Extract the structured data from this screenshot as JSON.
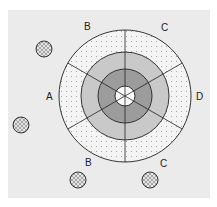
{
  "diagram": {
    "background_color": "#ebebeb",
    "target": {
      "center": [
        125,
        96
      ],
      "rings": [
        {
          "name": "outer-ring",
          "radius": 66,
          "fill": "dotted",
          "color": "#f3f3f3"
        },
        {
          "name": "middle-ring",
          "radius": 44,
          "fill": "light-gray",
          "color": "#c8c8c8"
        },
        {
          "name": "inner-ring",
          "radius": 27,
          "fill": "dark-gray",
          "color": "#9a9a9a"
        },
        {
          "name": "bullseye",
          "radius": 10,
          "fill": "white",
          "color": "#ffffff"
        }
      ],
      "spokes": 6
    },
    "labels": [
      {
        "text": "B",
        "x": 87,
        "y": 30,
        "position": "top-left"
      },
      {
        "text": "C",
        "x": 164,
        "y": 31,
        "position": "top-right"
      },
      {
        "text": "A",
        "x": 49,
        "y": 100,
        "position": "left"
      },
      {
        "text": "D",
        "x": 199,
        "y": 100,
        "position": "right"
      },
      {
        "text": "B",
        "x": 88,
        "y": 166,
        "position": "bottom-left"
      },
      {
        "text": "C",
        "x": 163,
        "y": 167,
        "position": "bottom-right"
      }
    ],
    "hatched_circles": [
      {
        "x": 44,
        "y": 49
      },
      {
        "x": 21,
        "y": 125
      },
      {
        "x": 78,
        "y": 180
      },
      {
        "x": 150,
        "y": 180
      }
    ]
  }
}
